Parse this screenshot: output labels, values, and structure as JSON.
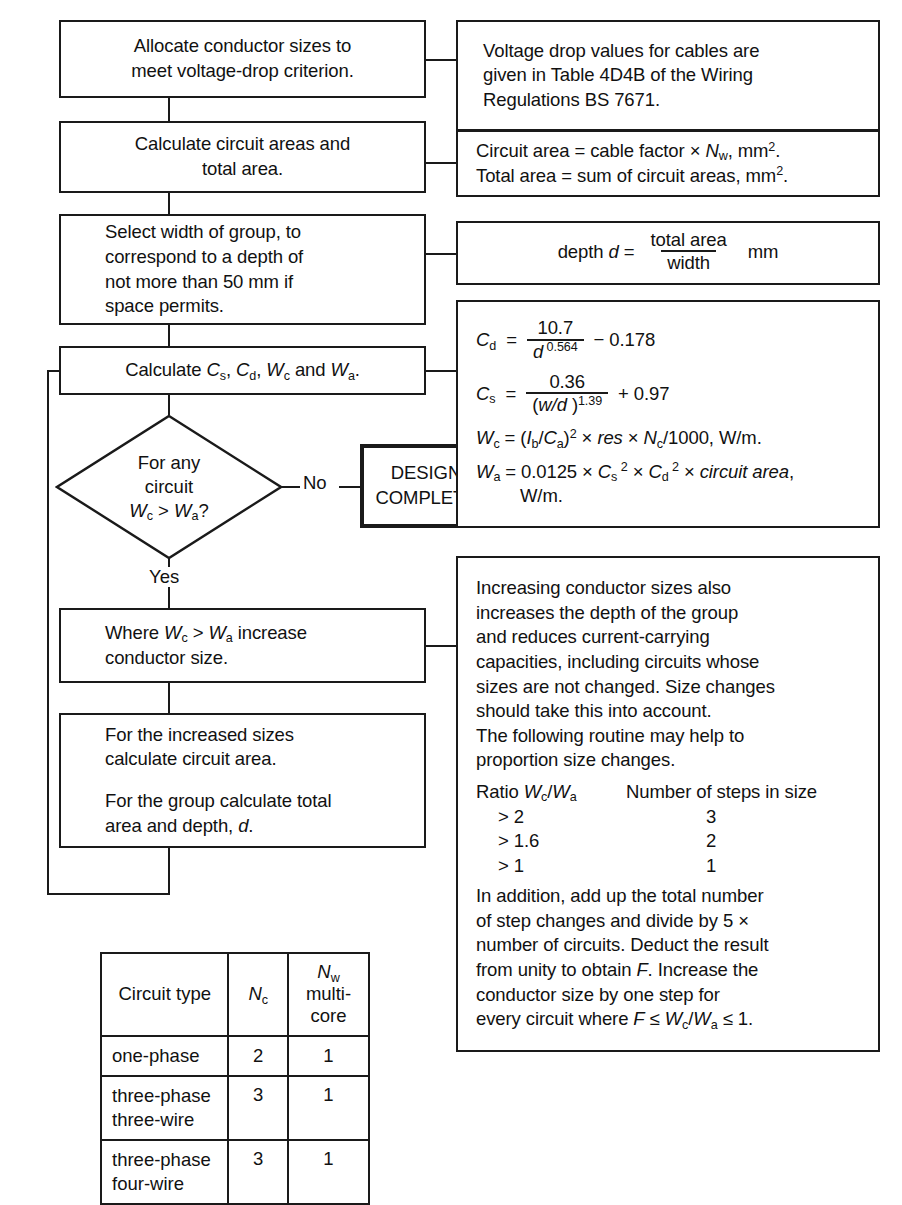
{
  "diagram": {
    "flow_boxes": [
      {
        "id": "allocate",
        "lines": [
          "Allocate conductor sizes to",
          "meet voltage-drop criterion."
        ]
      },
      {
        "id": "calc-areas",
        "lines": [
          "Calculate circuit areas and",
          "total area."
        ]
      },
      {
        "id": "select-width",
        "lines": [
          "Select width of group, to",
          "correspond to a depth of",
          "not more than 50 mm if",
          "space permits."
        ]
      },
      {
        "id": "calc-c",
        "text": "Calculate Cs, Cd, Wc and Wa."
      },
      {
        "id": "increase",
        "lines": [
          "Where Wc > Wa increase",
          "conductor size."
        ]
      },
      {
        "id": "recalc",
        "lines": [
          "For the increased sizes",
          "calculate circuit area.",
          "For the group calculate total",
          "area and depth, d."
        ]
      }
    ],
    "decision": {
      "lines": [
        "For any",
        "circuit",
        "Wc > Wa?"
      ],
      "no_label": "No",
      "yes_label": "Yes"
    },
    "terminal": {
      "line1": "DESIGN",
      "line2": "COMPLETE"
    },
    "notes": {
      "voltage_drop": [
        "Voltage drop values for cables are",
        "given in Table 4D4B of the Wiring",
        "Regulations BS 7671."
      ],
      "circuit_area": {
        "line1_a": "Circuit area = cable factor × ",
        "line1_b": "N",
        "line1_sub": "w",
        "line1_c": ", mm",
        "line1_sup": "2",
        "line1_d": ".",
        "line2_a": "Total area = sum of circuit areas, mm",
        "line2_sup": "2",
        "line2_b": "."
      },
      "depth": {
        "label": "depth",
        "var": "d",
        "eq": "=",
        "numerator": "total area",
        "denominator": "width",
        "unit": "mm"
      },
      "formulas": {
        "cd": {
          "lhs": "C",
          "lhs_sub": "d",
          "num": "10.7",
          "den_base": "d",
          "den_exp": "0.564",
          "tail": "− 0.178"
        },
        "cs": {
          "lhs": "C",
          "lhs_sub": "s",
          "num": "0.36",
          "den_base": "(w/d )",
          "den_exp": "1.39",
          "tail": "+ 0.97"
        },
        "wc": {
          "text": "Wc = (Ib/Ca)2 × res × Nc/1000, W/m."
        },
        "wa": {
          "text": "Wa = 0.0125 × Cs2 × Cd2 × circuit area,",
          "cont": "W/m."
        }
      },
      "increasing": {
        "paragraph": [
          "Increasing conductor sizes also",
          "increases the  depth of the  group",
          "and reduces current-carrying",
          "capacities, including circuits whose",
          "sizes are not changed.  Size changes",
          "should take this into account.",
          "The following routine may help to",
          "proportion size changes."
        ],
        "ratio_table": {
          "header_left": "Ratio Wc/Wa",
          "header_right": "Number of steps in size",
          "rows": [
            {
              "ratio": "> 2",
              "steps": "3"
            },
            {
              "ratio": "> 1.6",
              "steps": "2"
            },
            {
              "ratio": "> 1",
              "steps": "1"
            }
          ]
        },
        "closing": [
          "In addition, add up the total number",
          "of step changes and divide by 5 ×",
          "number of circuits. Deduct the result",
          "from unity to obtain F. Increase the",
          "conductor size by one step for",
          "every circuit where F ≤ Wc/Wa ≤ 1."
        ]
      }
    },
    "table": {
      "headers": {
        "col1": "Circuit type",
        "col2_base": "N",
        "col2_sub": "c",
        "col3_base": "N",
        "col3_sub": "w",
        "col3_rest": " multi-",
        "col3_line2": "core"
      },
      "rows": [
        {
          "type": [
            "one-phase"
          ],
          "nc": "2",
          "nw": "1"
        },
        {
          "type": [
            "three-phase",
            "three-wire"
          ],
          "nc": "3",
          "nw": "1"
        },
        {
          "type": [
            "three-phase",
            "four-wire"
          ],
          "nc": "3",
          "nw": "1"
        }
      ]
    }
  },
  "colors": {
    "ink": "#1a1a1a",
    "paper": "#ffffff"
  }
}
